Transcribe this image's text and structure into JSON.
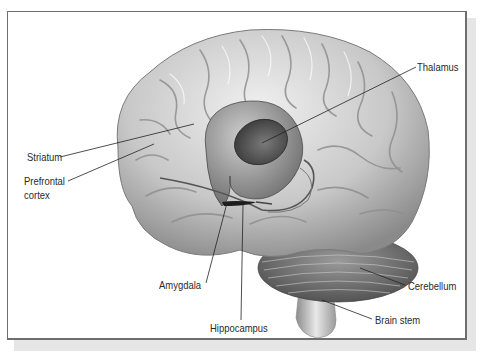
{
  "figure": {
    "colors": {
      "frame_border": "#6e6e6e",
      "shadow": "#e6e6e6",
      "brain_light": "#e4e4e4",
      "brain_mid": "#b5b5b5",
      "brain_dark": "#6a6a6a",
      "label_text": "#2a2a2a",
      "leader_line": "#222222"
    },
    "labels": {
      "thalamus": "Thalamus",
      "striatum": "Striatum",
      "prefrontal_line1": "Prefrontal",
      "prefrontal_line2": "cortex",
      "amygdala": "Amygdala",
      "hippocampus": "Hippocampus",
      "cerebellum": "Cerebellum",
      "brain_stem": "Brain stem"
    }
  }
}
